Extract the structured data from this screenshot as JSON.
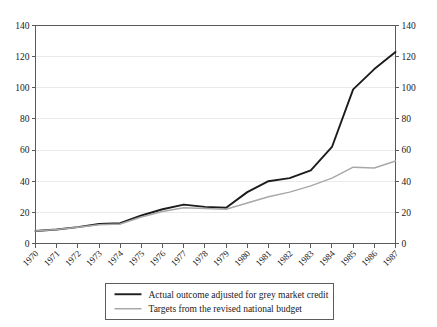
{
  "chart_data": {
    "type": "line",
    "title": "",
    "subtitle": "",
    "xlabel": "",
    "ylabel": "",
    "ylim": [
      0,
      140
    ],
    "ytick_step": 20,
    "yticks": [
      0,
      20,
      40,
      60,
      80,
      100,
      120,
      140
    ],
    "ytick_labels": [
      "0",
      "20",
      "40",
      "60",
      "80",
      "100",
      "120",
      "140"
    ],
    "y_axis_left": true,
    "y_axis_right": true,
    "grid": true,
    "grid_axis": "y",
    "legend_position": "bottom-center",
    "x": [
      1970,
      1971,
      1972,
      1973,
      1974,
      1975,
      1976,
      1977,
      1978,
      1979,
      1980,
      1981,
      1982,
      1983,
      1984,
      1985,
      1986,
      1987
    ],
    "categories": [
      "1970",
      "1971",
      "1972",
      "1973",
      "1974",
      "1975",
      "1976",
      "1977",
      "1978",
      "1979",
      "1980",
      "1981",
      "1982",
      "1983",
      "1984",
      "1985",
      "1986",
      "1987"
    ],
    "xtick_label_rotation": -45,
    "series": [
      {
        "name": "Actual outcome adjusted for grey market credit",
        "color": "#1c1c1c",
        "values": [
          8,
          9,
          10.5,
          12.5,
          13,
          18,
          22,
          25,
          23.5,
          23,
          33,
          40,
          42,
          47,
          62,
          99,
          112,
          123
        ]
      },
      {
        "name": "Targets from the revised national budget",
        "color": "#a8a8a8",
        "values": [
          8,
          9,
          10.5,
          12,
          12.5,
          17,
          20.5,
          23,
          22.5,
          22,
          26,
          30,
          33,
          37,
          42,
          49,
          48.5,
          53
        ]
      }
    ]
  },
  "legend": {
    "entries": [
      {
        "label": "Actual outcome adjusted for grey market credit",
        "color": "#1c1c1c"
      },
      {
        "label": "Targets from the revised national budget",
        "color": "#a8a8a8"
      }
    ]
  },
  "colors": {
    "background": "#ffffff",
    "axis": "#5a5a5a",
    "grid": "#e8e8e8",
    "text": "#1a1a1a",
    "series_actual": "#1c1c1c",
    "series_target": "#a8a8a8"
  }
}
